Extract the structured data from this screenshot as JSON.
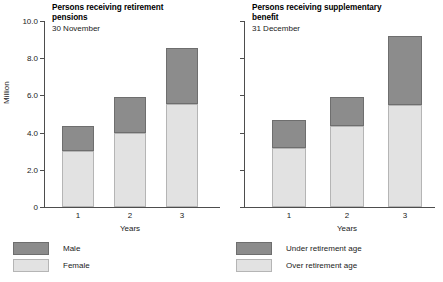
{
  "chart_data": [
    {
      "type": "bar",
      "title": "Persons receiving retirement pensions",
      "subtitle": "30 November",
      "xlabel": "Years",
      "ylabel": "Million",
      "categories": [
        "1",
        "2",
        "3"
      ],
      "ylim": [
        0,
        10
      ],
      "yticks": [
        "0",
        "2.0",
        "4.0",
        "6.0",
        "8.0",
        "10.0"
      ],
      "ytick_values": [
        0,
        2,
        4,
        6,
        8,
        10
      ],
      "grid": false,
      "stacked": true,
      "legend_position": "bottom-left",
      "series": [
        {
          "name": "Female",
          "values": [
            3.0,
            4.0,
            5.55
          ],
          "color": "#e2e2e2"
        },
        {
          "name": "Male",
          "values": [
            1.35,
            1.9,
            3.0
          ],
          "color": "#8c8c8c"
        }
      ],
      "totals": [
        4.35,
        5.9,
        8.55
      ]
    },
    {
      "type": "bar",
      "title": "Persons receiving supplementary benefit",
      "subtitle": "31 December",
      "xlabel": "Years",
      "ylabel": "",
      "categories": [
        "1",
        "2",
        "3"
      ],
      "ylim": [
        0,
        10
      ],
      "yticks": [
        "",
        "",
        "",
        "",
        "",
        ""
      ],
      "ytick_values": [
        0,
        2,
        4,
        6,
        8,
        10
      ],
      "grid": false,
      "stacked": true,
      "legend_position": "bottom-left",
      "series": [
        {
          "name": "Over retirement age",
          "values": [
            3.15,
            4.35,
            5.5
          ],
          "color": "#e2e2e2"
        },
        {
          "name": "Under retirement age",
          "values": [
            1.55,
            1.55,
            3.7
          ],
          "color": "#8c8c8c"
        }
      ],
      "totals": [
        4.7,
        5.9,
        9.2
      ]
    }
  ],
  "left_panel": {
    "title": "Persons receiving retirement\npensions",
    "subtitle": "30 November",
    "axis_y_title": "Million",
    "axis_x_title": "Years",
    "yticks": [
      {
        "label": "10.0",
        "value": 10
      },
      {
        "label": "8.0",
        "value": 8
      },
      {
        "label": "6.0",
        "value": 6
      },
      {
        "label": "4.0",
        "value": 4
      },
      {
        "label": "2.0",
        "value": 2
      },
      {
        "label": "0",
        "value": 0
      }
    ],
    "xticks": [
      "1",
      "2",
      "3"
    ],
    "legend": [
      {
        "label": "Male",
        "swatch": "dark"
      },
      {
        "label": "Female",
        "swatch": "light"
      }
    ]
  },
  "right_panel": {
    "title": "Persons receiving supplementary\nbenefit",
    "subtitle": "31 December",
    "axis_y_title": "",
    "axis_x_title": "Years",
    "yticks": [
      {
        "label": "",
        "value": 10
      },
      {
        "label": "",
        "value": 8
      },
      {
        "label": "",
        "value": 6
      },
      {
        "label": "",
        "value": 4
      },
      {
        "label": "",
        "value": 2
      },
      {
        "label": "",
        "value": 0
      }
    ],
    "xticks": [
      "1",
      "2",
      "3"
    ],
    "legend": [
      {
        "label": "Under retirement age",
        "swatch": "dark"
      },
      {
        "label": "Over retirement age",
        "swatch": "light"
      }
    ]
  },
  "colors": {
    "dark_segment": "#8c8c8c",
    "light_segment": "#e2e2e2",
    "axis": "#4d4d4d",
    "text": "#1a1a1a",
    "background": "#ffffff"
  }
}
